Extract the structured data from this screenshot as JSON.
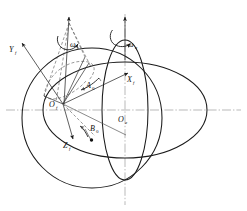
{
  "figure": {
    "type": "technical-line-diagram",
    "background_color": "#ffffff",
    "line_color": "#1a1a1a",
    "guide_color": "#8a8a8a"
  },
  "labels": {
    "omega_s": {
      "symbol": "ω",
      "subscript": "s",
      "x": 74,
      "y": 44,
      "meaning": "cone-spin-angular-rate"
    },
    "omega_e": {
      "symbol": "ω",
      "subscript": "e",
      "x": 131,
      "y": 44,
      "meaning": "earth-rotation-angular-rate"
    },
    "Y_f": {
      "symbol": "Y",
      "subscript": "f",
      "x": 11,
      "y": 50,
      "meaning": "body-frame-y-axis"
    },
    "X_f": {
      "symbol": "X",
      "subscript": "f",
      "x": 130,
      "y": 80,
      "meaning": "body-frame-x-axis"
    },
    "Z_f": {
      "symbol": "Z",
      "subscript": "f",
      "x": 66,
      "y": 146,
      "meaning": "body-frame-z-axis"
    },
    "O_f": {
      "symbol": "O",
      "subscript": "f",
      "x": 52,
      "y": 106,
      "meaning": "body-frame-origin"
    },
    "O_e": {
      "symbol": "O",
      "subscript": "e",
      "x": 121,
      "y": 120,
      "meaning": "earth-frame-origin"
    },
    "A_0": {
      "symbol": "A",
      "subscript": "0",
      "x": 88,
      "y": 89,
      "meaning": "azimuth-angle"
    },
    "B_0": {
      "symbol": "B",
      "subscript": "0",
      "x": 95,
      "y": 133,
      "meaning": "elevation-angle"
    }
  },
  "geometry": {
    "equator_ellipse": {
      "cx": 125,
      "cy": 110,
      "rx": 82,
      "ry": 48
    },
    "sphere_circle": {
      "cx": 92,
      "cy": 118,
      "r": 70
    },
    "meridian_ellipse": {
      "cx": 125,
      "cy": 110,
      "rx": 23,
      "ry": 70
    },
    "polar_axis": {
      "x": 125,
      "y_top": 18,
      "y_bottom": 200
    },
    "equator_axis": {
      "y": 110,
      "x_left": 8,
      "x_right": 240
    },
    "cone_apex": {
      "x": 69,
      "y": 22
    },
    "origin_f": {
      "x": 63,
      "y": 104
    },
    "point_b0": {
      "x": 91,
      "y": 140
    }
  },
  "vectors": [
    {
      "name": "Y_f",
      "from": [
        63,
        104
      ],
      "to": [
        21,
        42
      ]
    },
    {
      "name": "X_f",
      "from": [
        63,
        104
      ],
      "to": [
        127,
        74
      ]
    },
    {
      "name": "Z_f",
      "from": [
        63,
        104
      ],
      "to": [
        72,
        138
      ]
    },
    {
      "name": "polar-axis-arrow",
      "from": [
        125,
        200
      ],
      "to": [
        125,
        18
      ]
    },
    {
      "name": "cone-axis-arrow",
      "from": [
        63,
        104
      ],
      "to": [
        69,
        22
      ]
    }
  ],
  "annotations": {
    "rotation_arrow_left": "curved arrow about cone axis",
    "rotation_arrow_right": "curved arrow about polar axis",
    "dashed_cone": "dashed generator lines of cone from apex to base circle"
  }
}
